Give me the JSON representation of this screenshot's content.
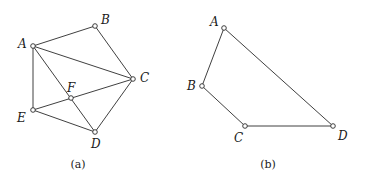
{
  "figures": [
    {
      "id": "a",
      "caption": "(a)",
      "caption_pos": [
        78,
        168
      ],
      "nodes": [
        {
          "name": "A",
          "x": 33,
          "y": 46,
          "lx": 18,
          "ly": 48
        },
        {
          "name": "B",
          "x": 95,
          "y": 26,
          "lx": 101,
          "ly": 24
        },
        {
          "name": "C",
          "x": 133,
          "y": 79,
          "lx": 140,
          "ly": 82
        },
        {
          "name": "F",
          "x": 71,
          "y": 98,
          "lx": 67,
          "ly": 92
        },
        {
          "name": "E",
          "x": 33,
          "y": 110,
          "lx": 17,
          "ly": 122
        },
        {
          "name": "D",
          "x": 95,
          "y": 132,
          "lx": 91,
          "ly": 148
        }
      ],
      "edges": [
        [
          "A",
          "B"
        ],
        [
          "B",
          "C"
        ],
        [
          "A",
          "C"
        ],
        [
          "A",
          "E"
        ],
        [
          "A",
          "D"
        ],
        [
          "E",
          "C"
        ],
        [
          "E",
          "D"
        ],
        [
          "C",
          "D"
        ]
      ]
    },
    {
      "id": "b",
      "caption": "(b)",
      "caption_pos": [
        268,
        168
      ],
      "nodes": [
        {
          "name": "A",
          "x": 224,
          "y": 28,
          "lx": 210,
          "ly": 26
        },
        {
          "name": "B",
          "x": 202,
          "y": 86,
          "lx": 187,
          "ly": 90
        },
        {
          "name": "C",
          "x": 245,
          "y": 126,
          "lx": 234,
          "ly": 142
        },
        {
          "name": "D",
          "x": 333,
          "y": 126,
          "lx": 338,
          "ly": 140
        }
      ],
      "edges": [
        [
          "A",
          "B"
        ],
        [
          "B",
          "C"
        ],
        [
          "C",
          "D"
        ],
        [
          "A",
          "D"
        ]
      ]
    }
  ]
}
